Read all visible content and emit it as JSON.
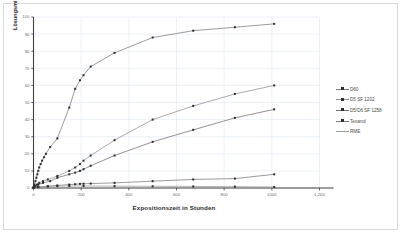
{
  "chart_data": {
    "type": "line",
    "title": "",
    "xlabel": "Expositionszeit in Stunden",
    "ylabel": "Lösungsmittel-Verlust in %",
    "xlim": [
      0,
      1200
    ],
    "ylim": [
      0,
      100
    ],
    "xticks": [
      "0",
      "200",
      "400",
      "600",
      "800",
      "1000",
      "1,200"
    ],
    "xtick_values": [
      0,
      200,
      400,
      600,
      800,
      1000,
      1200
    ],
    "yticks": [
      "0",
      "10",
      "20",
      "30",
      "40",
      "50",
      "60",
      "70",
      "80",
      "90",
      "100"
    ],
    "ytick_values": [
      0,
      10,
      20,
      30,
      40,
      50,
      60,
      70,
      80,
      90,
      100
    ],
    "grid": true,
    "legend_position": "right",
    "series": [
      {
        "name": "D60",
        "color": "#7b7b7b",
        "points": [
          [
            0,
            0
          ],
          [
            4,
            2
          ],
          [
            8,
            4
          ],
          [
            12,
            6
          ],
          [
            16,
            8
          ],
          [
            20,
            10
          ],
          [
            24,
            12
          ],
          [
            30,
            14
          ],
          [
            36,
            16
          ],
          [
            44,
            18
          ],
          [
            52,
            20
          ],
          [
            70,
            24
          ],
          [
            100,
            29
          ],
          [
            150,
            47
          ],
          [
            175,
            58
          ],
          [
            195,
            63
          ],
          [
            210,
            66
          ],
          [
            240,
            71
          ],
          [
            340,
            79
          ],
          [
            500,
            88
          ],
          [
            670,
            92
          ],
          [
            845,
            94
          ],
          [
            1010,
            96
          ]
        ]
      },
      {
        "name": "D5 SF 1202",
        "color": "#8f8f8f",
        "points": [
          [
            0,
            0
          ],
          [
            6,
            1
          ],
          [
            14,
            2
          ],
          [
            24,
            3
          ],
          [
            40,
            4
          ],
          [
            60,
            5
          ],
          [
            100,
            7
          ],
          [
            150,
            10
          ],
          [
            175,
            12
          ],
          [
            195,
            14
          ],
          [
            210,
            16
          ],
          [
            240,
            19
          ],
          [
            340,
            28
          ],
          [
            500,
            40
          ],
          [
            670,
            48
          ],
          [
            845,
            55
          ],
          [
            1010,
            60
          ]
        ]
      },
      {
        "name": "D5/D6 SF 1258",
        "color": "#6d6d6d",
        "points": [
          [
            0,
            0
          ],
          [
            8,
            1
          ],
          [
            20,
            2
          ],
          [
            40,
            3
          ],
          [
            70,
            4
          ],
          [
            100,
            6
          ],
          [
            150,
            8
          ],
          [
            175,
            9
          ],
          [
            195,
            10
          ],
          [
            210,
            11
          ],
          [
            240,
            13
          ],
          [
            340,
            19
          ],
          [
            500,
            27
          ],
          [
            670,
            34
          ],
          [
            845,
            41
          ],
          [
            1010,
            46
          ]
        ]
      },
      {
        "name": "Texanol",
        "color": "#7a7a7a",
        "points": [
          [
            0,
            0
          ],
          [
            20,
            0.5
          ],
          [
            60,
            1
          ],
          [
            100,
            1.5
          ],
          [
            150,
            2
          ],
          [
            175,
            2.2
          ],
          [
            195,
            2.4
          ],
          [
            210,
            2.5
          ],
          [
            240,
            2.6
          ],
          [
            340,
            3
          ],
          [
            500,
            4
          ],
          [
            670,
            5
          ],
          [
            845,
            5.5
          ],
          [
            1010,
            8
          ]
        ]
      },
      {
        "name": "RME",
        "color": "#9a9a9a",
        "points": [
          [
            0,
            0.6
          ],
          [
            20,
            0.8
          ],
          [
            60,
            1
          ],
          [
            100,
            1.1
          ],
          [
            150,
            1.2
          ],
          [
            210,
            1.2
          ],
          [
            340,
            1.1
          ],
          [
            500,
            1
          ],
          [
            670,
            0.9
          ],
          [
            845,
            0.8
          ],
          [
            1010,
            0.6
          ]
        ]
      }
    ]
  },
  "legend": {
    "items": [
      {
        "label": "D60"
      },
      {
        "label": "D5 SF 1202"
      },
      {
        "label": "D5/D6 SF 1258"
      },
      {
        "label": "Texanol"
      },
      {
        "label": "RME"
      }
    ]
  },
  "colors": {
    "grid": "#dce6f1",
    "axis": "#404040",
    "border": "#d9d9d9",
    "background": "#ffffff"
  }
}
